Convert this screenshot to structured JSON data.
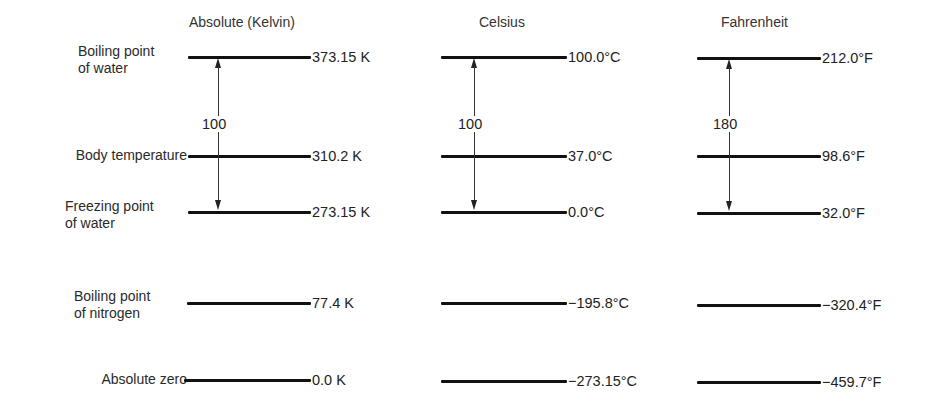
{
  "columns": [
    {
      "title": "Absolute (Kelvin)",
      "difference_label": "100",
      "values": [
        "373.15 K",
        "310.2 K",
        "273.15 K",
        "77.4 K",
        "0.0 K"
      ]
    },
    {
      "title": "Celsius",
      "difference_label": "100",
      "values": [
        "100.0°C",
        "37.0°C",
        "0.0°C",
        "−195.8°C",
        "−273.15°C"
      ]
    },
    {
      "title": "Fahrenheit",
      "difference_label": "180",
      "values": [
        "212.0°F",
        "98.6°F",
        "32.0°F",
        "−320.4°F",
        "−459.7°F"
      ]
    }
  ],
  "rows": [
    {
      "label_line1": "Boiling point",
      "label_line2": "of water"
    },
    {
      "label_line1": "Body temperature",
      "label_line2": ""
    },
    {
      "label_line1": "Freezing point",
      "label_line2": "of water"
    },
    {
      "label_line1": "Boiling point",
      "label_line2": "of nitrogen"
    },
    {
      "label_line1": "Absolute zero",
      "label_line2": ""
    }
  ],
  "colors": {
    "line": "#111111",
    "text": "#2a2a2a",
    "background": "#ffffff"
  }
}
